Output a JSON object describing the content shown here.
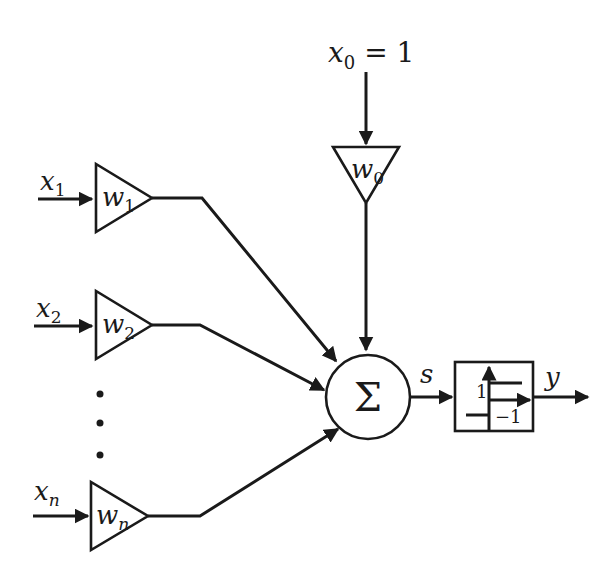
{
  "diagram": {
    "colors": {
      "stroke": "#1a1a1a",
      "background": "#ffffff"
    },
    "bias": {
      "input_var": "x",
      "input_sub": "0",
      "input_eq": " = 1",
      "weight_var": "w",
      "weight_sub": "0"
    },
    "inputs": [
      {
        "var": "x",
        "sub": "1",
        "weight_var": "w",
        "weight_sub": "1"
      },
      {
        "var": "x",
        "sub": "2",
        "weight_var": "w",
        "weight_sub": "2"
      },
      {
        "var": "x",
        "sub": "n",
        "weight_var": "w",
        "weight_sub": "n"
      }
    ],
    "ellipsis": "⋮",
    "summation": {
      "symbol": "Σ"
    },
    "sum_output_label": "s",
    "activation": {
      "type": "sign / step function",
      "high_label": "1",
      "low_label": "−1"
    },
    "output_label": "y"
  }
}
